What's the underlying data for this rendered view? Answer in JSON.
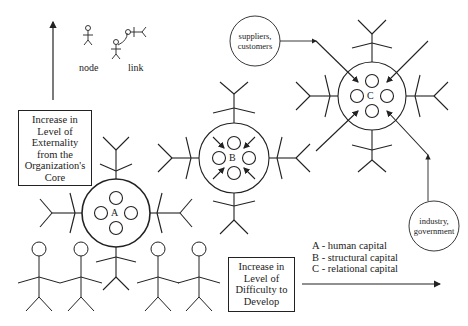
{
  "legend_icons": {
    "node_label": "node",
    "link_label": "link"
  },
  "vertical_axis": {
    "label_lines": [
      "Increase in",
      "Level of",
      "Externality",
      "from the",
      "Organization's",
      "Core"
    ]
  },
  "horizontal_axis": {
    "label_lines": [
      "Increase in",
      "Level of",
      "Difficulty to",
      "Develop"
    ]
  },
  "clusters": [
    {
      "id": "A",
      "label": "A"
    },
    {
      "id": "B",
      "label": "B"
    },
    {
      "id": "C",
      "label": "C"
    }
  ],
  "external_nodes": [
    {
      "id": "suppliers",
      "lines": [
        "suppliers,",
        "customers"
      ]
    },
    {
      "id": "industry",
      "lines": [
        "industry,",
        "government"
      ]
    }
  ],
  "key": [
    {
      "text": "A - human capital"
    },
    {
      "text": "B - structural capital"
    },
    {
      "text": "C - relational capital"
    }
  ]
}
